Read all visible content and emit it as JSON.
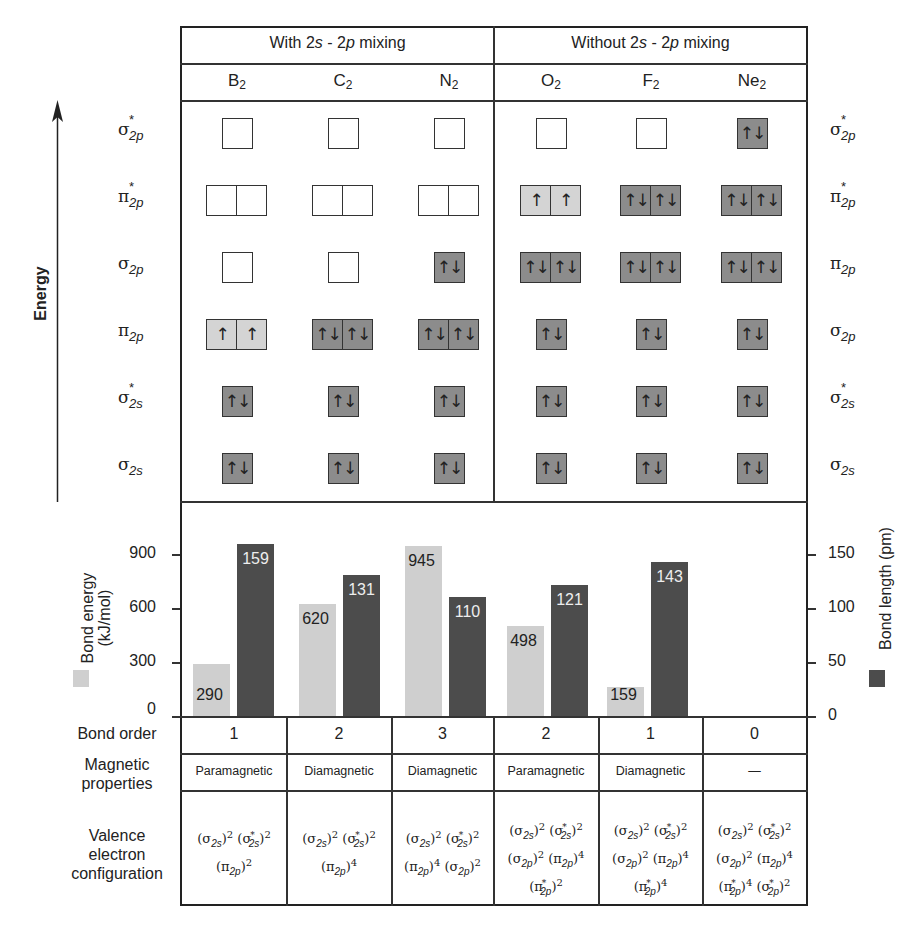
{
  "header": {
    "group_left": "With 2s-2p mixing",
    "group_left_parts": [
      "With 2",
      "s",
      " - 2",
      "p",
      " mixing"
    ],
    "group_right": "Without 2s-2p mixing",
    "group_right_parts": [
      "Without 2",
      "s",
      " - 2",
      "p",
      " mixing"
    ],
    "molecules": [
      {
        "symbol": "B",
        "sub": "2"
      },
      {
        "symbol": "C",
        "sub": "2"
      },
      {
        "symbol": "N",
        "sub": "2"
      },
      {
        "symbol": "O",
        "sub": "2"
      },
      {
        "symbol": "F",
        "sub": "2"
      },
      {
        "symbol": "Ne",
        "sub": "2"
      }
    ]
  },
  "energy_axis": {
    "label": "Energy"
  },
  "orbital_labels_left": [
    {
      "greek": "σ",
      "star": "*",
      "sub": "2p"
    },
    {
      "greek": "π",
      "star": "*",
      "sub": "2p"
    },
    {
      "greek": "σ",
      "star": "",
      "sub": "2p"
    },
    {
      "greek": "π",
      "star": "",
      "sub": "2p"
    },
    {
      "greek": "σ",
      "star": "*",
      "sub": "2s"
    },
    {
      "greek": "σ",
      "star": "",
      "sub": "2s"
    }
  ],
  "orbital_labels_right": [
    {
      "greek": "σ",
      "star": "*",
      "sub": "2p"
    },
    {
      "greek": "π",
      "star": "*",
      "sub": "2p"
    },
    {
      "greek": "π",
      "star": "",
      "sub": "2p"
    },
    {
      "greek": "σ",
      "star": "",
      "sub": "2p"
    },
    {
      "greek": "σ",
      "star": "*",
      "sub": "2s"
    },
    {
      "greek": "σ",
      "star": "",
      "sub": "2s"
    }
  ],
  "mo_diagram": {
    "arrow_up": "↑",
    "arrow_down": "↓",
    "columns": [
      {
        "molecule": "B2",
        "rows": [
          [
            "empty"
          ],
          [
            "empty",
            "empty"
          ],
          [
            "empty"
          ],
          [
            "up",
            "up"
          ],
          [
            "pair"
          ],
          [
            "pair"
          ]
        ]
      },
      {
        "molecule": "C2",
        "rows": [
          [
            "empty"
          ],
          [
            "empty",
            "empty"
          ],
          [
            "empty"
          ],
          [
            "pair",
            "pair"
          ],
          [
            "pair"
          ],
          [
            "pair"
          ]
        ]
      },
      {
        "molecule": "N2",
        "rows": [
          [
            "empty"
          ],
          [
            "empty",
            "empty"
          ],
          [
            "pair"
          ],
          [
            "pair",
            "pair"
          ],
          [
            "pair"
          ],
          [
            "pair"
          ]
        ]
      },
      {
        "molecule": "O2",
        "rows": [
          [
            "empty"
          ],
          [
            "up",
            "up"
          ],
          [
            "pair",
            "pair"
          ],
          [
            "pair"
          ],
          [
            "pair"
          ],
          [
            "pair"
          ]
        ]
      },
      {
        "molecule": "F2",
        "rows": [
          [
            "empty"
          ],
          [
            "pair",
            "pair"
          ],
          [
            "pair",
            "pair"
          ],
          [
            "pair"
          ],
          [
            "pair"
          ],
          [
            "pair"
          ]
        ]
      },
      {
        "molecule": "Ne2",
        "rows": [
          [
            "pair"
          ],
          [
            "pair",
            "pair"
          ],
          [
            "pair",
            "pair"
          ],
          [
            "pair"
          ],
          [
            "pair"
          ],
          [
            "pair"
          ]
        ]
      }
    ]
  },
  "colors": {
    "empty_orbital": "#ffffff",
    "half_filled_orbital": "#d4d4d4",
    "filled_orbital": "#8c8c8c",
    "bond_energy_bar": "#cfcfcf",
    "bond_length_bar": "#4c4c4c"
  },
  "chart_data": {
    "type": "bar",
    "title": "",
    "categories": [
      "B2",
      "C2",
      "N2",
      "O2",
      "F2",
      "Ne2"
    ],
    "series": [
      {
        "name": "Bond energy (kJ/mol)",
        "axis": "left",
        "color": "#cfcfcf",
        "values": [
          290,
          620,
          945,
          498,
          159,
          null
        ]
      },
      {
        "name": "Bond length (pm)",
        "axis": "right",
        "color": "#4c4c4c",
        "values": [
          159,
          131,
          110,
          121,
          143,
          null
        ]
      }
    ],
    "ylabel_left": "Bond energy (kJ/mol)",
    "ylabel_right": "Bond length (pm)",
    "yticks_left": [
      0,
      300,
      600,
      900
    ],
    "yticks_right": [
      0,
      50,
      100,
      150
    ],
    "ylim_left": [
      0,
      1100
    ],
    "ylim_right": [
      0,
      183
    ],
    "grid": false,
    "legend_position": "axis-labels"
  },
  "chart": {
    "ylabel_left_line1": "Bond energy",
    "ylabel_left_line2": "(kJ/mol)",
    "ylabel_right": "Bond length (pm)",
    "ticks_left": [
      "900",
      "600",
      "300",
      "0"
    ],
    "ticks_right": [
      "150",
      "100",
      "50",
      "0"
    ],
    "energy_labels": [
      "290",
      "620",
      "945",
      "498",
      "159"
    ],
    "length_labels": [
      "159",
      "131",
      "110",
      "121",
      "143"
    ]
  },
  "table": {
    "row_labels": {
      "bond_order": "Bond order",
      "magnetic_1": "Magnetic",
      "magnetic_2": "properties",
      "config_1": "Valence",
      "config_2": "electron",
      "config_3": "configuration"
    },
    "bond_order": [
      "1",
      "2",
      "3",
      "2",
      "1",
      "0"
    ],
    "magnetic": [
      "Paramagnetic",
      "Diamagnetic",
      "Diamagnetic",
      "Paramagnetic",
      "Diamagnetic",
      "—"
    ],
    "configurations": [
      [
        "(σ2s)2 (σ*2s)2",
        "(π2p)2"
      ],
      [
        "(σ2s)2 (σ*2s)2",
        "(π2p)4"
      ],
      [
        "(σ2s)2 (σ*2s)2",
        "(π2p)4 (σ2p)2"
      ],
      [
        "(σ2s)2 (σ*2s)2",
        "(σ2p)2 (π2p)4",
        "(π*2p)2"
      ],
      [
        "(σ2s)2 (σ*2s)2",
        "(σ2p)2 (π2p)4",
        "(π*2p)4"
      ],
      [
        "(σ2s)2 (σ*2s)2",
        "(σ2p)2 (π2p)4",
        "(π*2p)4 (σ*2p)2"
      ]
    ]
  }
}
